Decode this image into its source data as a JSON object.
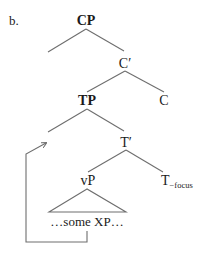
{
  "example_label": "b.",
  "nodes": {
    "cp": "CP",
    "c_bar": "C′",
    "tp": "TP",
    "c": "C",
    "t_bar": "T′",
    "vp": "vP",
    "t": "T",
    "t_subscript": "−focus",
    "triangle_content": "…some XP…"
  },
  "colors": {
    "text": "#1a1a1a",
    "lines": "#6e6e6e"
  }
}
